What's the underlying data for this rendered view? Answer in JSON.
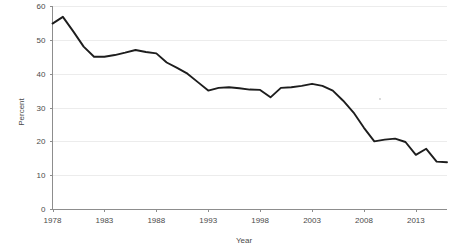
{
  "chart_data": {
    "type": "line",
    "title": "",
    "xlabel": "Year",
    "ylabel": "Percent",
    "xlim": [
      1978,
      2016
    ],
    "ylim": [
      0,
      60
    ],
    "grid": true,
    "legend": null,
    "x_tick_labels": [
      "1978",
      "1983",
      "1988",
      "1993",
      "1998",
      "2003",
      "2008",
      "2013"
    ],
    "x_ticks": [
      1978,
      1983,
      1988,
      1993,
      1998,
      2003,
      2008,
      2013
    ],
    "y_tick_labels": [
      "0",
      "10",
      "20",
      "30",
      "40",
      "50",
      "60"
    ],
    "y_ticks": [
      0,
      10,
      20,
      30,
      40,
      50,
      60
    ],
    "line_color": "#1d1d1d",
    "x": [
      1978,
      1979,
      1980,
      1981,
      1982,
      1983,
      1984,
      1985,
      1986,
      1987,
      1988,
      1989,
      1990,
      1991,
      1992,
      1993,
      1994,
      1995,
      1996,
      1997,
      1998,
      1999,
      2000,
      2001,
      2002,
      2003,
      2004,
      2005,
      2006,
      2007,
      2008,
      2009,
      2010,
      2011,
      2012,
      2013,
      2014,
      2015,
      2016
    ],
    "values": [
      54.8,
      56.8,
      52.5,
      48.0,
      45.0,
      45.0,
      45.5,
      46.2,
      47.0,
      46.4,
      46.0,
      43.3,
      41.7,
      40.0,
      37.5,
      35.0,
      35.8,
      36.0,
      35.7,
      35.3,
      35.2,
      33.0,
      35.8,
      36.0,
      36.4,
      37.0,
      36.4,
      35.0,
      32.0,
      28.5,
      24.0,
      20.0,
      20.5,
      20.8,
      19.8,
      16.0,
      17.8,
      14.0,
      13.8
    ],
    "series": [
      {
        "name": "Percent",
        "color": "#1d1d1d",
        "values": [
          54.8,
          56.8,
          52.5,
          48.0,
          45.0,
          45.0,
          45.5,
          46.2,
          47.0,
          46.4,
          46.0,
          43.3,
          41.7,
          40.0,
          37.5,
          35.0,
          35.8,
          36.0,
          35.7,
          35.3,
          35.2,
          33.0,
          35.8,
          36.0,
          36.4,
          37.0,
          36.4,
          35.0,
          32.0,
          28.5,
          24.0,
          20.0,
          20.5,
          20.8,
          19.8,
          16.0,
          17.8,
          14.0,
          13.8
        ]
      }
    ]
  },
  "axes": {
    "y_axis_title": "Percent",
    "x_axis_title": "Year"
  }
}
